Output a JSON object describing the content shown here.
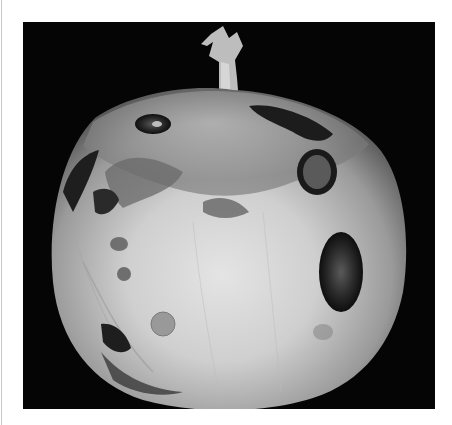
{
  "image": {
    "subject": "diseased onion bulb with dark sunken lesions",
    "background_color": "#050505",
    "border_color": "#ffffff",
    "palette": {
      "bulb_light": "#d8d8d8",
      "bulb_mid": "#a8a8a8",
      "bulb_shadow": "#6a6a6a",
      "lesion_dark": "#1a1a1a",
      "lesion_mid": "#4a4a4a"
    }
  }
}
